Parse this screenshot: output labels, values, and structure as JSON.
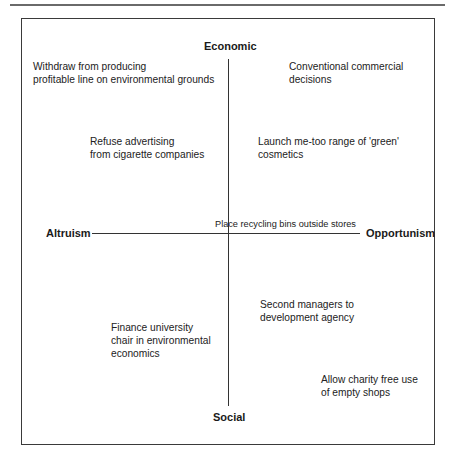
{
  "diagram": {
    "axes": {
      "top": "Economic",
      "bottom": "Social",
      "left": "Altruism",
      "right": "Opportunism"
    },
    "items": [
      {
        "id": "withdraw",
        "quadrant": "top-left",
        "lines": [
          "Withdraw from producing",
          "profitable line on environmental grounds"
        ]
      },
      {
        "id": "conventional",
        "quadrant": "top-right",
        "lines": [
          "Conventional commercial",
          "decisions"
        ]
      },
      {
        "id": "refuse-advertising",
        "quadrant": "top-left",
        "lines": [
          "Refuse advertising",
          "from cigarette companies"
        ]
      },
      {
        "id": "launch-cosmetics",
        "quadrant": "top-right",
        "lines": [
          "Launch me-too range of 'green'",
          "cosmetics"
        ]
      },
      {
        "id": "recycling-bins",
        "quadrant": "center",
        "lines": [
          "Place recycling bins outside stores"
        ]
      },
      {
        "id": "second-managers",
        "quadrant": "bottom-right",
        "lines": [
          "Second managers to",
          "development agency"
        ]
      },
      {
        "id": "finance-chair",
        "quadrant": "bottom-left",
        "lines": [
          "Finance university",
          "chair in environmental",
          "economics"
        ]
      },
      {
        "id": "charity-shops",
        "quadrant": "bottom-right",
        "lines": [
          "Allow charity free use",
          "of empty shops"
        ]
      }
    ]
  }
}
